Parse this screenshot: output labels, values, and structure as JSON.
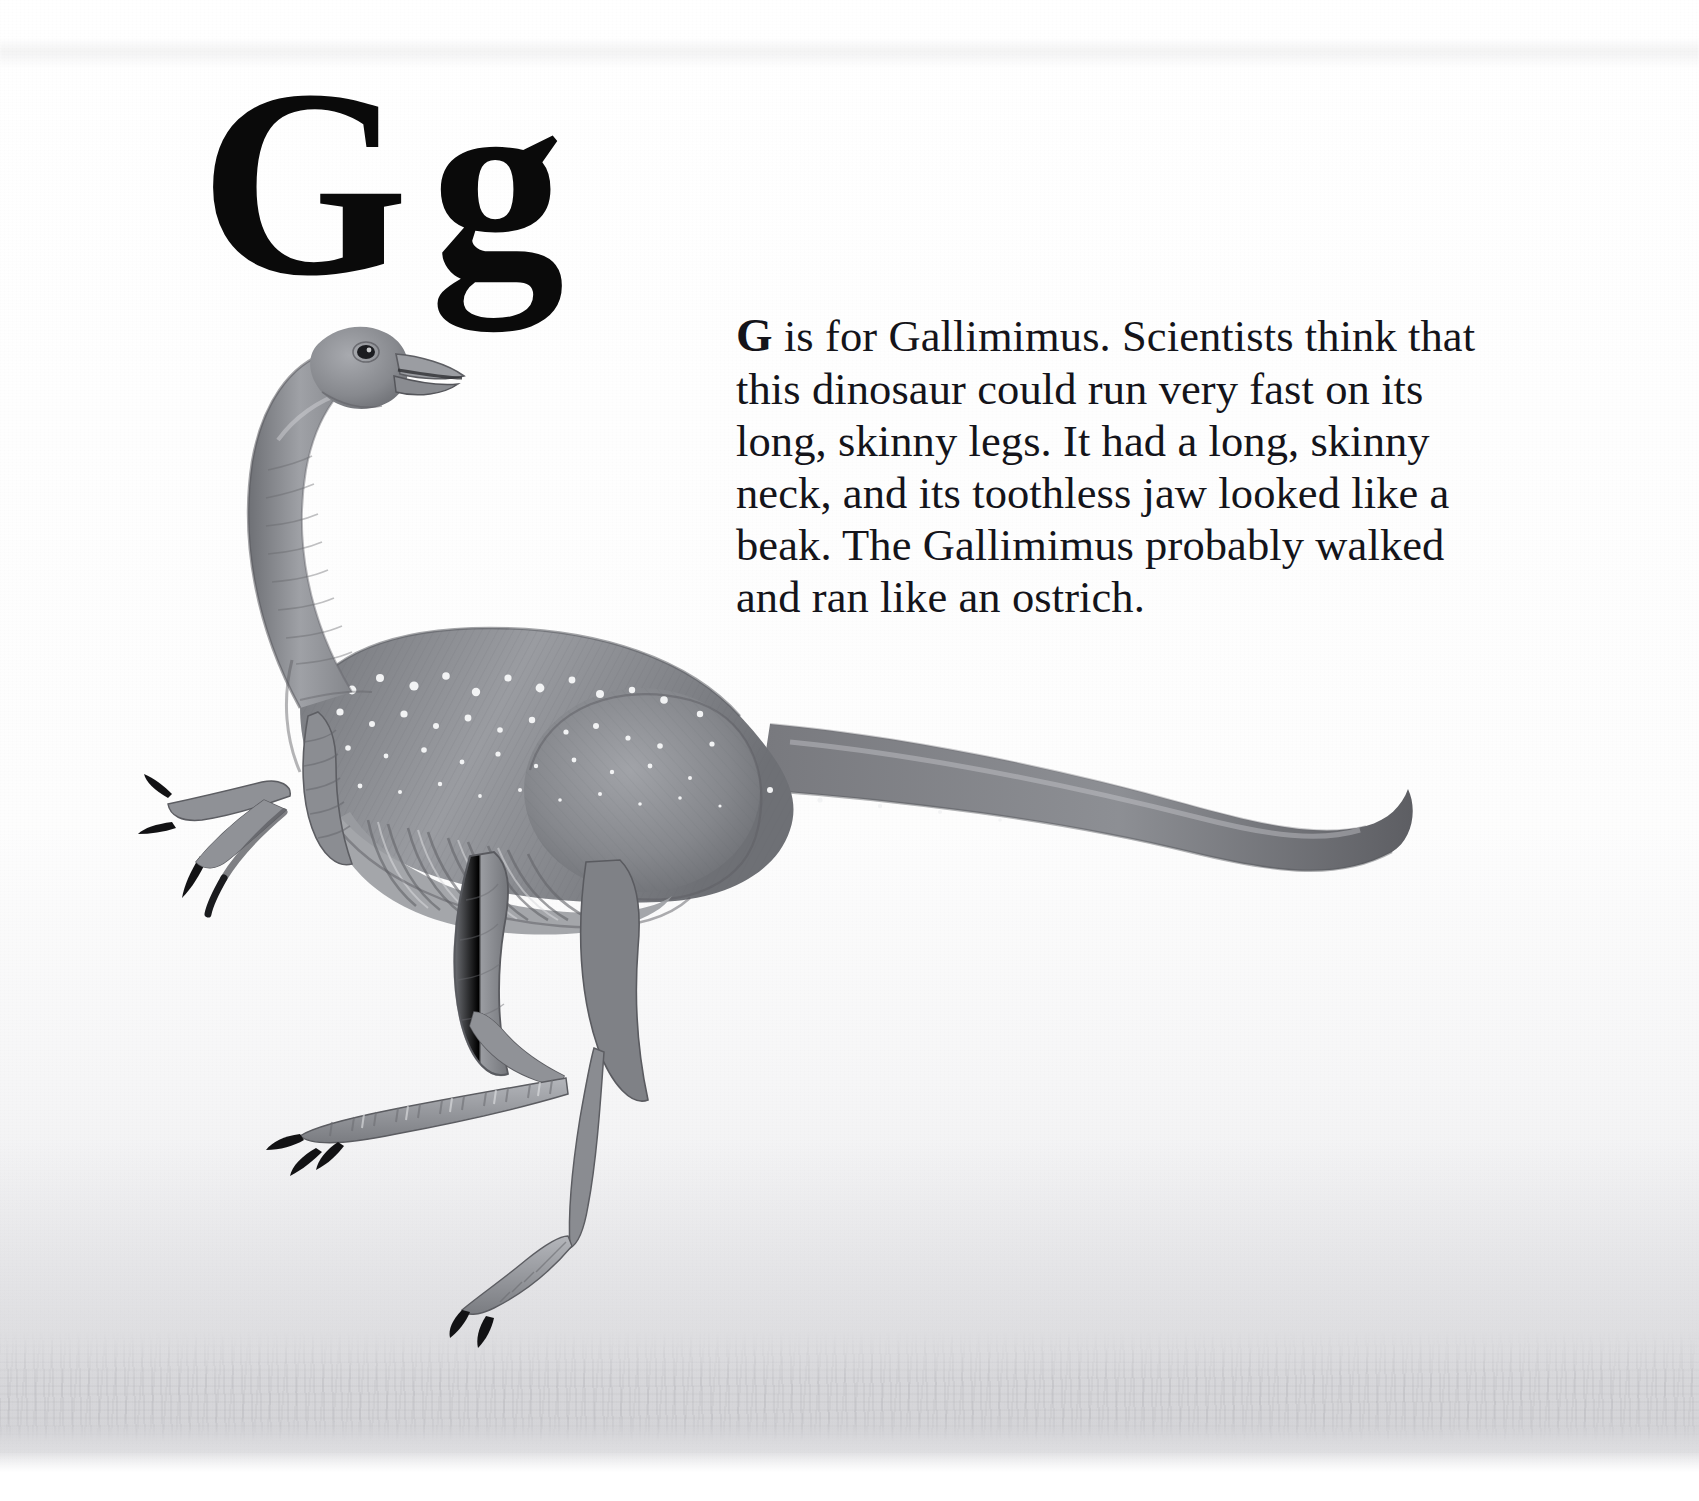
{
  "page": {
    "kind": "alphabet-book-page",
    "background_color": "#ffffff",
    "ink_color": "#14141a"
  },
  "letter_heading": {
    "uppercase": "G",
    "lowercase": "g",
    "combined": "G g"
  },
  "body_text": {
    "lead_capital": "G",
    "rest": " is for Gallimimus. Scientists think that this dinosaur could run very fast on its long, skinny legs. It had a long, skinny neck, and its toothless jaw looked like a beak. The Gallimimus probably walked and ran like an ostrich.",
    "full": "G is for Gallimimus. Scientists think that this dinosaur could run very fast on its long, skinny legs. It had a long, skinny neck, and its toothless jaw looked like a beak. The Gallimimus probably walked and ran like an ostrich.",
    "lines": [
      "G is for Gallimimus. Scientists think",
      "that this dinosaur could run very fast on",
      "its long, skinny legs. It had a long, skinny",
      "neck, and its toothless jaw looked like a",
      "beak. The Gallimimus probably walked",
      "and ran like an ostrich."
    ]
  },
  "illustration": {
    "subject": "Gallimimus",
    "medium": "graphite pencil drawing",
    "palette": {
      "body_dark": "#6f7075",
      "body_mid": "#8e9095",
      "body_light": "#b9bbc0",
      "highlight": "#e9eaec",
      "claw": "#101013",
      "outline": "#5b5c61",
      "ground": "#d6d7da"
    },
    "features": [
      "long skinny neck",
      "toothless beak-like jaw",
      "small head with dark eye",
      "speckled white spots on back and flank",
      "visible rib cage / gastralia",
      "three-clawed hands",
      "long skinny hind legs",
      "long tapering tail curving upward at the tip"
    ]
  }
}
